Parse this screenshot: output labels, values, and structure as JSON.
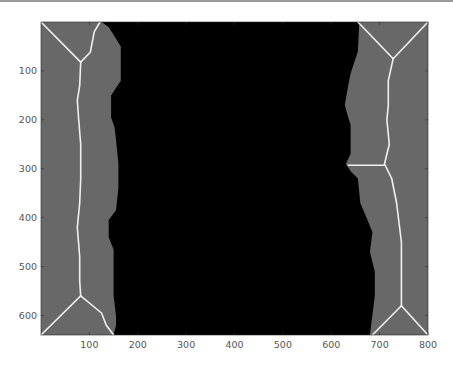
{
  "chart_data": {
    "type": "heatmap",
    "title": "",
    "xlabel": "",
    "ylabel": "",
    "xlim": [
      0,
      800
    ],
    "ylim": [
      640,
      0
    ],
    "y_axis_reversed": true,
    "grid": false,
    "legend": null,
    "x_ticks": [
      100,
      200,
      300,
      400,
      500,
      600,
      700,
      800
    ],
    "y_ticks": [
      100,
      200,
      300,
      400,
      500,
      600
    ],
    "x_tick_labels": [
      "100",
      "200",
      "300",
      "400",
      "500",
      "600",
      "700",
      "800"
    ],
    "y_tick_labels": [
      "100",
      "200",
      "300",
      "400",
      "500",
      "600"
    ],
    "colors": {
      "background_region": "#686868",
      "central_region": "#000000",
      "skeleton_lines": "#f0f0f0"
    },
    "left_region_boundary": [
      [
        125,
        0
      ],
      [
        140,
        10
      ],
      [
        165,
        50
      ],
      [
        165,
        120
      ],
      [
        155,
        135
      ],
      [
        145,
        150
      ],
      [
        145,
        195
      ],
      [
        152,
        215
      ],
      [
        155,
        240
      ],
      [
        160,
        290
      ],
      [
        160,
        340
      ],
      [
        155,
        385
      ],
      [
        140,
        405
      ],
      [
        140,
        440
      ],
      [
        150,
        465
      ],
      [
        150,
        560
      ],
      [
        155,
        600
      ],
      [
        155,
        620
      ],
      [
        150,
        640
      ]
    ],
    "right_region_boundary": [
      [
        658,
        0
      ],
      [
        655,
        60
      ],
      [
        640,
        105
      ],
      [
        635,
        130
      ],
      [
        628,
        170
      ],
      [
        635,
        195
      ],
      [
        640,
        210
      ],
      [
        640,
        270
      ],
      [
        630,
        290
      ],
      [
        640,
        305
      ],
      [
        655,
        320
      ],
      [
        660,
        370
      ],
      [
        675,
        405
      ],
      [
        685,
        430
      ],
      [
        680,
        470
      ],
      [
        690,
        510
      ],
      [
        690,
        560
      ],
      [
        680,
        640
      ]
    ],
    "skeleton_left": {
      "top_branch_a": [
        [
          0,
          0
        ],
        [
          82,
          82
        ]
      ],
      "top_branch_b": [
        [
          82,
          82
        ],
        [
          102,
          62
        ],
        [
          110,
          20
        ],
        [
          122,
          0
        ]
      ],
      "spine": [
        [
          82,
          82
        ],
        [
          80,
          130
        ],
        [
          75,
          160
        ],
        [
          78,
          200
        ],
        [
          82,
          250
        ],
        [
          82,
          320
        ],
        [
          80,
          370
        ],
        [
          75,
          420
        ],
        [
          80,
          480
        ],
        [
          80,
          530
        ],
        [
          82,
          560
        ]
      ],
      "bottom_branch_a": [
        [
          82,
          560
        ],
        [
          0,
          640
        ]
      ],
      "bottom_branch_b": [
        [
          82,
          560
        ],
        [
          125,
          595
        ],
        [
          135,
          620
        ],
        [
          150,
          640
        ]
      ]
    },
    "skeleton_right": {
      "top_branch_a": [
        [
          655,
          0
        ],
        [
          728,
          75
        ]
      ],
      "top_branch_b": [
        [
          728,
          75
        ],
        [
          800,
          0
        ]
      ],
      "spine": [
        [
          728,
          75
        ],
        [
          718,
          120
        ],
        [
          718,
          170
        ],
        [
          715,
          200
        ],
        [
          720,
          250
        ],
        [
          710,
          290
        ],
        [
          725,
          320
        ],
        [
          735,
          370
        ],
        [
          740,
          410
        ],
        [
          745,
          450
        ],
        [
          745,
          580
        ]
      ],
      "spur": [
        [
          710,
          293
        ],
        [
          635,
          293
        ]
      ],
      "bottom_branch_a": [
        [
          745,
          580
        ],
        [
          685,
          640
        ]
      ],
      "bottom_branch_b": [
        [
          745,
          580
        ],
        [
          800,
          640
        ]
      ]
    }
  }
}
